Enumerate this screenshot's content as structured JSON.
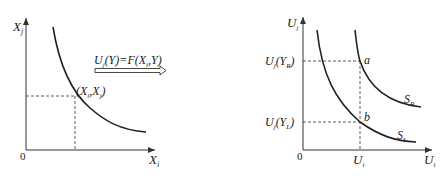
{
  "left_panel": {
    "y_axis_label": "X",
    "y_axis_sub": "j",
    "x_axis_label": "X",
    "x_axis_sub": "i",
    "origin_label": "0",
    "point_label": "(X",
    "point_label_sub1": "i",
    "point_label_mid": ",X",
    "point_label_sub2": "j",
    "point_label_end": ")"
  },
  "transform": {
    "label_prefix": "U",
    "label_prefix_sub": "j",
    "label_mid": "(Y)=F(X",
    "label_mid_sub": "i",
    "label_end": ",Y)",
    "arrow": "hollow-right-arrow"
  },
  "right_panel": {
    "y_axis_label": "U",
    "y_axis_sub": "j",
    "x_axis_label": "U",
    "x_axis_sub": "i",
    "origin_label": "0",
    "x_tick_label": "U",
    "x_tick_sub": "i",
    "y_tick_high": "U",
    "y_tick_high_sub": "j",
    "y_tick_high_arg": "(Y",
    "y_tick_high_arg_sub": "R",
    "y_tick_high_end": ")",
    "y_tick_low": "U",
    "y_tick_low_sub": "j",
    "y_tick_low_arg": "(Y",
    "y_tick_low_arg_sub": "L",
    "y_tick_low_end": ")",
    "point_a": "a",
    "point_b": "b",
    "curve_right_label": "S",
    "curve_right_sub": "R",
    "curve_left_label": "S",
    "curve_left_sub": "L"
  }
}
